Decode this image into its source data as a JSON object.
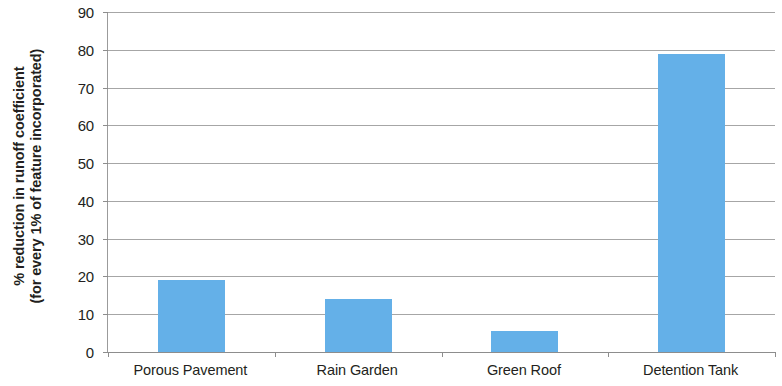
{
  "chart_data": {
    "type": "bar",
    "title": "",
    "xlabel": "",
    "ylabel_line1": "% reduction in runoff coefficient",
    "ylabel_line2": "(for every 1% of feature incorporated)",
    "categories": [
      "Porous Pavement",
      "Rain Garden",
      "Green Roof",
      "Detention Tank"
    ],
    "values": [
      19,
      14,
      5.5,
      79
    ],
    "ylim": [
      0,
      90
    ],
    "ytick_labels": [
      "0",
      "10",
      "20",
      "30",
      "40",
      "50",
      "60",
      "70",
      "80",
      "90"
    ],
    "ytick_values": [
      0,
      10,
      20,
      30,
      40,
      50,
      60,
      70,
      80,
      90
    ],
    "grid": true,
    "legend": "none",
    "bar_color": "#64b0e8",
    "axis_color": "#8d8d8d",
    "grid_color": "#a6a6a6",
    "text_color": "#231f20"
  }
}
